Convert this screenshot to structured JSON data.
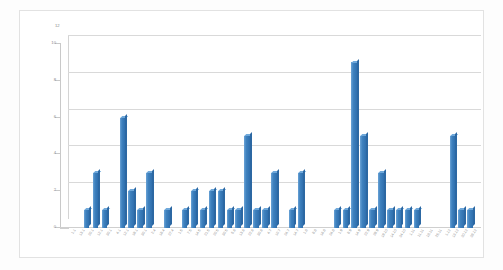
{
  "chart_data": {
    "type": "bar",
    "title": "",
    "subtitle": "",
    "xlabel": "",
    "ylabel": "",
    "ylim": [
      0,
      10
    ],
    "y_ticks": [
      0,
      2,
      4,
      6,
      8,
      10
    ],
    "top_axis_marker": "12",
    "grid": true,
    "legend": false,
    "legend_position": "none",
    "style": "3d-clustered-column",
    "series_name": "",
    "bar_color": "#3f82bf",
    "bar_color_side": "#2c68a3",
    "bar_color_top": "#6fa8da",
    "gridline_color": "#d9d9d9",
    "plot_background": "#ffffff",
    "categories": [
      "1.1",
      "13.1",
      "20.1",
      "12.1",
      "30.1",
      "4.1",
      "12.1",
      "19.1",
      "30.1",
      "2.4",
      "18.4",
      "27.4",
      "1.5",
      "7.5",
      "14.5",
      "21.5",
      "20.5",
      "30.5",
      "5.6",
      "13.6",
      "22.6",
      "30.6",
      "4.7",
      "10.7",
      "24.7",
      "14.7",
      "1.8",
      "8.8",
      "16.8",
      "24.8",
      "1.9",
      "8.9",
      "14.9",
      "22.9",
      "29.9",
      "19.10",
      "14.10",
      "24.10",
      "1.11",
      "11.11",
      "18.11",
      "25.11",
      "1.12",
      "13.12",
      "20.12",
      "28.12"
    ],
    "values": [
      0,
      0,
      1,
      3,
      1,
      0,
      6,
      2,
      1,
      3,
      0,
      1,
      0,
      1,
      2,
      1,
      2,
      2,
      1,
      1,
      5,
      1,
      1,
      3,
      0,
      1,
      3,
      0,
      0,
      0,
      1,
      1,
      9,
      5,
      1,
      3,
      1,
      1,
      1,
      1,
      0,
      0,
      0,
      5,
      1,
      1
    ]
  }
}
